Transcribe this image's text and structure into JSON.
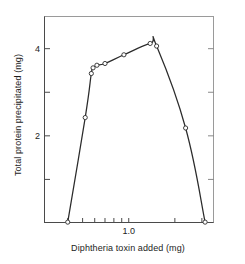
{
  "chart_data": {
    "type": "line",
    "title": "",
    "xlabel": "Diphtheria toxin added (mg)",
    "ylabel": "Total protein precipitated (mg)",
    "x_scale": "log",
    "xlim": [
      0.28,
      3.6
    ],
    "ylim": [
      0,
      4.75
    ],
    "grid": false,
    "legend": null,
    "marker": "open-circle",
    "line_color": "#2b2b2b",
    "x_ticks_labeled": [
      {
        "value": 1.0,
        "label": "1.0"
      }
    ],
    "x_ticks_minor": [
      0.4,
      0.5,
      0.6,
      0.7,
      0.8,
      0.9,
      1.0,
      2.0,
      3.0
    ],
    "y_ticks_labeled": [
      {
        "value": 4,
        "label": "4"
      },
      {
        "value": 2,
        "label": "2"
      }
    ],
    "y_ticks_minor": [
      1,
      2,
      3,
      4
    ],
    "series": [
      {
        "name": "Total protein precipitated",
        "points": [
          {
            "x": 0.4,
            "y": 0.02
          },
          {
            "x": 0.52,
            "y": 2.42
          },
          {
            "x": 0.57,
            "y": 3.43
          },
          {
            "x": 0.585,
            "y": 3.56
          },
          {
            "x": 0.62,
            "y": 3.62
          },
          {
            "x": 0.7,
            "y": 3.66
          },
          {
            "x": 0.93,
            "y": 3.86
          },
          {
            "x": 1.38,
            "y": 4.12
          },
          {
            "x": 1.52,
            "y": 4.06
          },
          {
            "x": 2.35,
            "y": 2.18
          },
          {
            "x": 3.15,
            "y": 0.02
          }
        ]
      }
    ]
  }
}
